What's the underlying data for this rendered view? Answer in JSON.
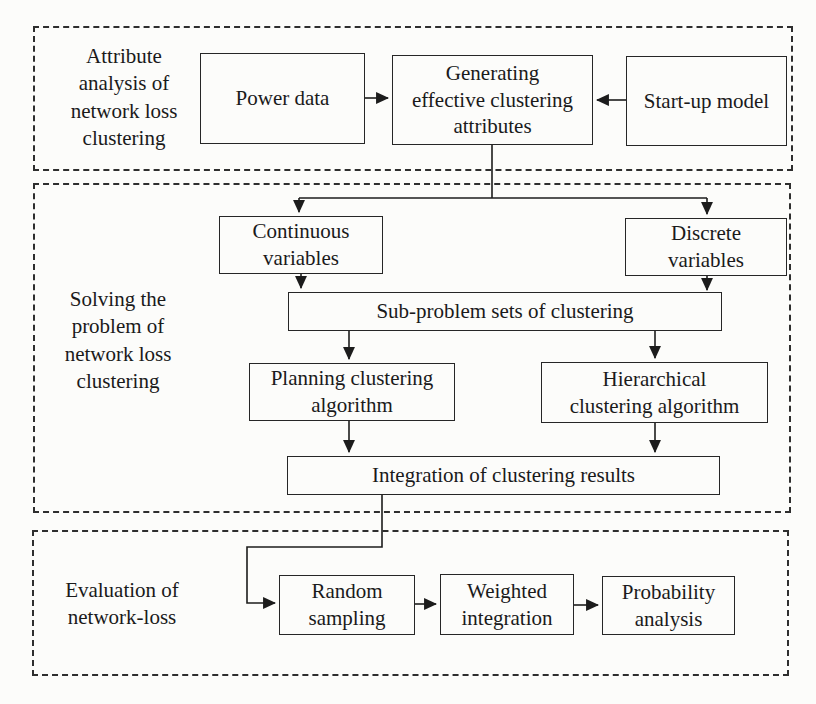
{
  "diagram": {
    "type": "flowchart",
    "colors": {
      "ink": "#1c1c1c",
      "paper": "#fcfcfa",
      "box_border": "#262626",
      "dashed_border": "#2e2e2e"
    },
    "sections": {
      "attribute_analysis": {
        "label": "Attribute\nanalysis of\nnetwork loss\nclustering",
        "nodes": {
          "power_data": "Power data",
          "generating_attributes": "Generating\neffective clustering\nattributes",
          "startup_model": "Start-up model"
        }
      },
      "solving": {
        "label": "Solving the\nproblem of\nnetwork loss\nclustering",
        "nodes": {
          "continuous_variables": "Continuous\nvariables",
          "discrete_variables": "Discrete\nvariables",
          "subproblem_sets": "Sub-problem sets of clustering",
          "planning_algorithm": "Planning clustering\nalgorithm",
          "hierarchical_algorithm": "Hierarchical\nclustering algorithm",
          "integration_results": "Integration of clustering results"
        }
      },
      "evaluation": {
        "label": "Evaluation of\nnetwork-loss",
        "nodes": {
          "random_sampling": "Random\nsampling",
          "weighted_integration": "Weighted\nintegration",
          "probability_analysis": "Probability\nanalysis"
        }
      }
    },
    "edges": [
      {
        "from": "power_data",
        "to": "generating_attributes"
      },
      {
        "from": "startup_model",
        "to": "generating_attributes"
      },
      {
        "from": "generating_attributes",
        "to": "continuous_variables"
      },
      {
        "from": "generating_attributes",
        "to": "discrete_variables"
      },
      {
        "from": "continuous_variables",
        "to": "subproblem_sets"
      },
      {
        "from": "discrete_variables",
        "to": "subproblem_sets"
      },
      {
        "from": "subproblem_sets",
        "to": "planning_algorithm"
      },
      {
        "from": "subproblem_sets",
        "to": "hierarchical_algorithm"
      },
      {
        "from": "planning_algorithm",
        "to": "integration_results"
      },
      {
        "from": "hierarchical_algorithm",
        "to": "integration_results"
      },
      {
        "from": "integration_results",
        "to": "random_sampling"
      },
      {
        "from": "random_sampling",
        "to": "weighted_integration"
      },
      {
        "from": "weighted_integration",
        "to": "probability_analysis"
      }
    ]
  }
}
